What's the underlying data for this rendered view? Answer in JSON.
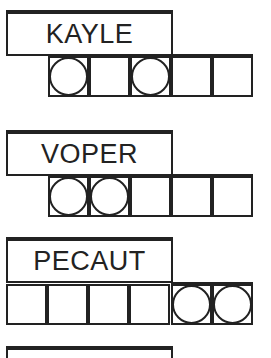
{
  "puzzles": [
    {
      "scrambled": "KAYLE",
      "cells": 5,
      "circled": [
        0,
        2
      ],
      "offset": 1
    },
    {
      "scrambled": "VOPER",
      "cells": 5,
      "circled": [
        0,
        1
      ],
      "offset": 1
    },
    {
      "scrambled": "PECAUT",
      "cells": 6,
      "circled": [
        4,
        5
      ],
      "offset": 0
    }
  ],
  "colors": {
    "ink": "#222222",
    "background": "#ffffff"
  }
}
